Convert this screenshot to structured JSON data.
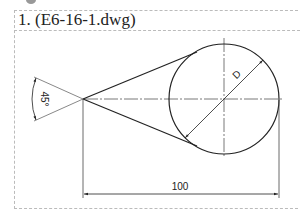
{
  "exercise": {
    "title": "1. (E6-16-1.dwg)"
  },
  "drawing": {
    "angle_label": "45°",
    "diameter_label": "D",
    "length_label": "100",
    "line_color": "#222222",
    "center_line_color": "#555555"
  }
}
